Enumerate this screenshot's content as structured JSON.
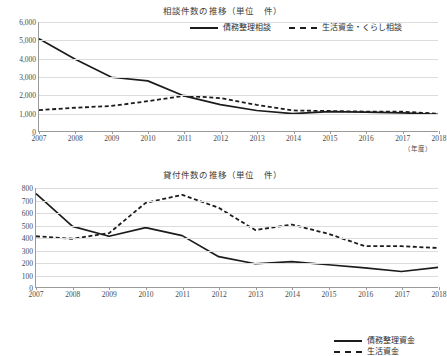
{
  "charts": [
    {
      "id": "top",
      "title": "相談件数の推移（単位　件）",
      "axis_unit_label": "（年度）",
      "legend": [
        {
          "label": "債務整理相談",
          "style": "solid"
        },
        {
          "label": "生活資金・くらし相談",
          "style": "dashed"
        }
      ]
    },
    {
      "id": "bottom",
      "title": "貸付件数の推移（単位　件）",
      "legend": [
        {
          "label": "債務整理資金",
          "style": "solid"
        },
        {
          "label": "生活資金",
          "style": "dashed"
        }
      ]
    }
  ],
  "chart_data": [
    {
      "type": "line",
      "title": "相談件数の推移（単位　件）",
      "xlabel": "（年度）",
      "ylabel": "",
      "categories": [
        2007,
        2008,
        2009,
        2010,
        2011,
        2012,
        2013,
        2014,
        2015,
        2016,
        2017,
        2018
      ],
      "xtick_labels": [
        "2007",
        "2008",
        "2009",
        "2010",
        "2011",
        "2012",
        "2013",
        "2014",
        "2015",
        "2016",
        "2017",
        "2018"
      ],
      "ytick_labels": [
        "0",
        "1,000",
        "2,000",
        "3,000",
        "4,000",
        "5,000",
        "6,000"
      ],
      "yticks": [
        0,
        1000,
        2000,
        3000,
        4000,
        5000,
        6000
      ],
      "ylim": [
        0,
        6000
      ],
      "grid": true,
      "legend_position": "top-right",
      "series": [
        {
          "name": "債務整理相談",
          "style": "solid",
          "values": [
            5080,
            3950,
            2960,
            2760,
            1930,
            1450,
            1130,
            960,
            1070,
            1040,
            1000,
            920
          ]
        },
        {
          "name": "生活資金・くらし相談",
          "style": "dashed",
          "values": [
            1150,
            1280,
            1380,
            1640,
            1940,
            1810,
            1440,
            1130,
            1100,
            1070,
            1070,
            950
          ]
        }
      ]
    },
    {
      "type": "line",
      "title": "貸付件数の推移（単位　件）",
      "xlabel": "",
      "ylabel": "",
      "categories": [
        2007,
        2008,
        2009,
        2010,
        2011,
        2012,
        2013,
        2014,
        2015,
        2016,
        2017,
        2018
      ],
      "xtick_labels": [
        "2007",
        "2008",
        "2009",
        "2010",
        "2011",
        "2012",
        "2013",
        "2014",
        "2015",
        "2016",
        "2017",
        "2018"
      ],
      "ytick_labels": [
        "0",
        "100",
        "200",
        "300",
        "400",
        "500",
        "600",
        "700",
        "800"
      ],
      "yticks": [
        0,
        100,
        200,
        300,
        400,
        500,
        600,
        700,
        800
      ],
      "ylim": [
        0,
        800
      ],
      "grid": true,
      "legend_position": "top-right",
      "series": [
        {
          "name": "債務整理資金",
          "style": "solid",
          "values": [
            755,
            490,
            410,
            480,
            415,
            245,
            188,
            205,
            180,
            155,
            125,
            158
          ]
        },
        {
          "name": "生活資金",
          "style": "dashed",
          "values": [
            410,
            390,
            435,
            680,
            745,
            640,
            460,
            505,
            430,
            330,
            330,
            315
          ]
        }
      ]
    }
  ]
}
